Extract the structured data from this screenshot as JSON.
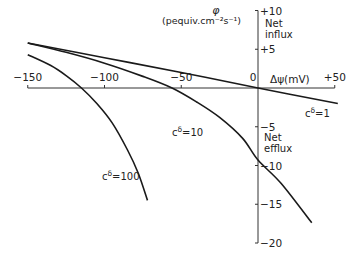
{
  "chart_data": {
    "type": "line",
    "title": "",
    "xlabel": "Δψ(mV)",
    "ylabel": "φ",
    "ylabel_units": "(pequiv.cm⁻²s⁻¹)",
    "xlim": [
      -150,
      50
    ],
    "ylim": [
      -20,
      10
    ],
    "x_ticks": [
      "-150",
      "-100",
      "-50",
      "0",
      "+50"
    ],
    "y_ticks": [
      "+10",
      "+5",
      "-5",
      "-10",
      "-15",
      "-20"
    ],
    "annotations": {
      "upper": [
        "Net",
        "influx"
      ],
      "lower": [
        "Net",
        "efflux"
      ]
    },
    "grid": false,
    "series": [
      {
        "name": "c^δ=1",
        "label_sup": "δ",
        "label_pre": "c",
        "label_post": "=1",
        "points": [
          [
            -150,
            5.8
          ],
          [
            -100,
            3.9
          ],
          [
            -50,
            2.0
          ],
          [
            0,
            0
          ],
          [
            52,
            -2.0
          ]
        ]
      },
      {
        "name": "c^δ=10",
        "label_sup": "δ",
        "label_pre": "c",
        "label_post": "=10",
        "points": [
          [
            -150,
            5.8
          ],
          [
            -125,
            4.6
          ],
          [
            -100,
            3.2
          ],
          [
            -75,
            1.5
          ],
          [
            -56,
            0
          ],
          [
            -40,
            -1.8
          ],
          [
            -25,
            -3.8
          ],
          [
            -10,
            -6.5
          ],
          [
            0,
            -9.3
          ],
          [
            15,
            -12.3
          ],
          [
            35,
            -17.4
          ]
        ]
      },
      {
        "name": "c^δ=100",
        "label_sup": "δ",
        "label_pre": "c",
        "label_post": "=100",
        "points": [
          [
            -150,
            4.3
          ],
          [
            -135,
            2.9
          ],
          [
            -125,
            1.6
          ],
          [
            -115,
            0
          ],
          [
            -105,
            -2.0
          ],
          [
            -95,
            -4.5
          ],
          [
            -85,
            -8.0
          ],
          [
            -78,
            -11.0
          ],
          [
            -72,
            -14.5
          ]
        ]
      }
    ]
  }
}
